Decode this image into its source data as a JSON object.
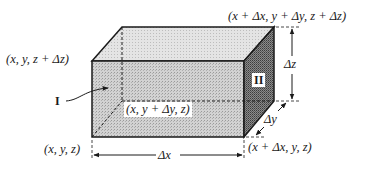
{
  "diagram": {
    "labels": {
      "corner_origin": "(x, y, z)",
      "corner_top_left": "(x, y, z + Δz)",
      "corner_top_far": "(x + Δx, y + Δy, z + Δz)",
      "corner_back_bottom": "(x, y + Δy, z)",
      "corner_bottom_right": "(x + Δx, y, z)",
      "face_I": "I",
      "face_II": "II",
      "dim_x": "Δx",
      "dim_y": "Δy",
      "dim_z": "Δz"
    },
    "colors": {
      "outline": "#1a1a1a",
      "top_face": "#e2e2e2",
      "front_face": "#cdcdcd",
      "side_face": "#7d7d7d",
      "background": "#ffffff"
    }
  }
}
